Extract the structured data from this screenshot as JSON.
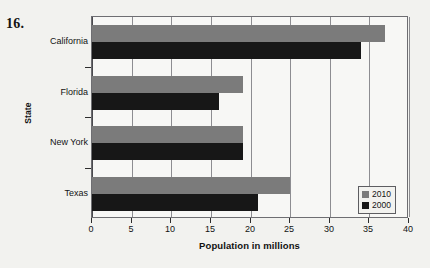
{
  "question_number": "16.",
  "chart_data": {
    "type": "bar",
    "orientation": "horizontal",
    "title": "",
    "xlabel": "Population in millions",
    "ylabel": "State",
    "categories": [
      "California",
      "Florida",
      "New York",
      "Texas"
    ],
    "series": [
      {
        "name": "2010",
        "color": "#7b7b7b",
        "values": [
          37,
          19,
          19,
          25
        ]
      },
      {
        "name": "2000",
        "color": "#171717",
        "values": [
          34,
          16,
          19,
          21
        ]
      }
    ],
    "xlim": [
      0,
      40
    ],
    "xticks": [
      0,
      5,
      10,
      15,
      20,
      25,
      30,
      35,
      40
    ],
    "xtick_labels": [
      "0",
      "5",
      "10",
      "15",
      "20",
      "25",
      "30",
      "35",
      "40"
    ],
    "grid": "vertical",
    "legend_position": "bottom-right",
    "legend_entries": [
      "2010",
      "2000"
    ]
  }
}
